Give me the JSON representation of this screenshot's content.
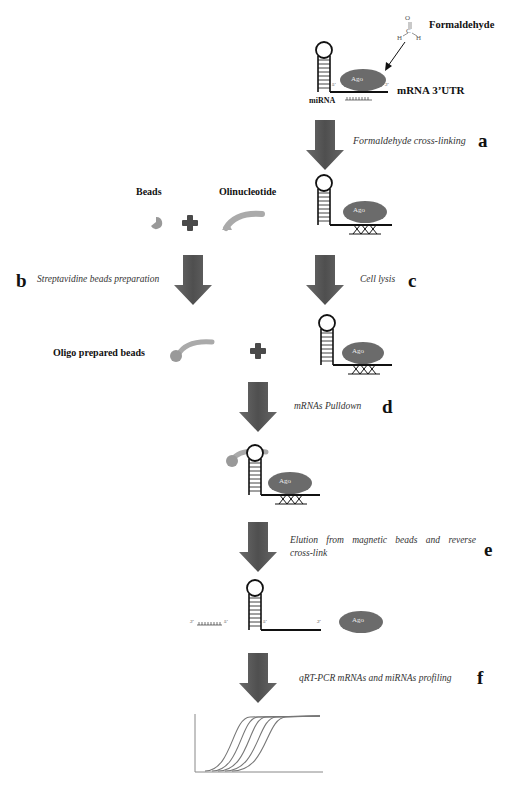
{
  "colors": {
    "arrow": "#555555",
    "ago": "#6b6b6b",
    "bead": "#9a9a9a",
    "plus": "#4a4a4a",
    "text": "#111111"
  },
  "top": {
    "formaldehyde_label": "Formaldehyde",
    "molecule": {
      "o": "O",
      "c": "C",
      "h1": "H",
      "h2": "H"
    },
    "mirna_label": "miRNA",
    "mrna_label": "mRNA 3’UTR",
    "ago": "Ago",
    "five_prime": "5'",
    "three_prime": "3'"
  },
  "steps": [
    {
      "letter": "a",
      "text": "Formaldehyde cross-linking"
    },
    {
      "letter": "b",
      "text": "Streptavidine beads preparation"
    },
    {
      "letter": "c",
      "text": "Cell lysis"
    },
    {
      "letter": "d",
      "text": "mRNAs Pulldown"
    },
    {
      "letter": "e",
      "text": "Elution from magnetic beads and reverse",
      "text2": "cross-link"
    },
    {
      "letter": "f",
      "text": "qRT-PCR mRNAs and miRNAs profiling"
    }
  ],
  "components": {
    "beads": "Beads",
    "oligo": "Olinucleotide",
    "oligo_beads": "Oligo prepared beads"
  },
  "primes": {
    "p5": "5'",
    "p3": "3'"
  }
}
